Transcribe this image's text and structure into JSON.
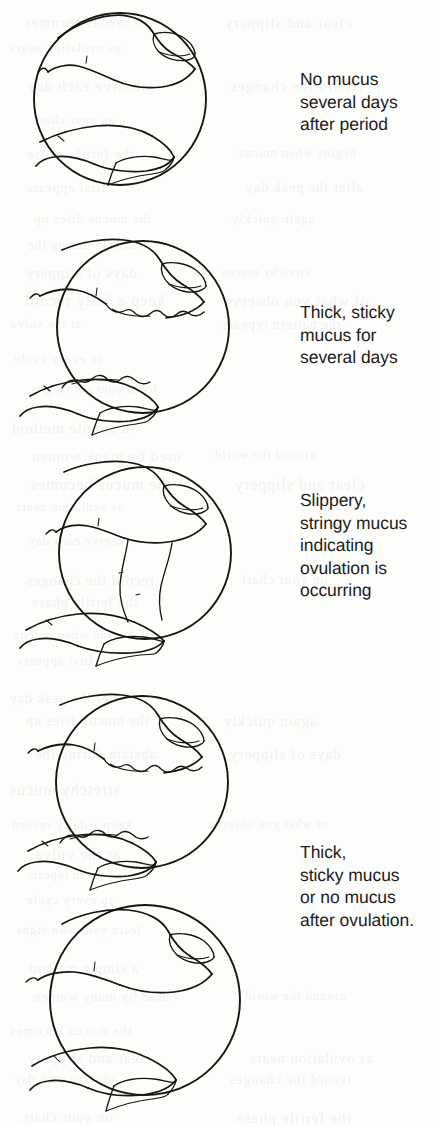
{
  "figure": {
    "medium": "line drawing",
    "panel_count": 5,
    "caption_count": 4,
    "ink_color": "#16150f",
    "page_color": "#fdfdfc",
    "page_width": 440,
    "page_height": 1126
  },
  "panels": [
    {
      "index": 1,
      "illustration_name": "fingers-no-mucus",
      "description": "Two fingertips apart, clean, no mucus strand",
      "circle": {
        "cx": 120,
        "cy": 99,
        "r": 86
      },
      "mucus_state": "none"
    },
    {
      "index": 2,
      "illustration_name": "fingers-thick-sticky-mucus",
      "description": "Two fingertips with thick lumpy sticky mucus on each pad",
      "circle": {
        "cx": 143,
        "cy": 327,
        "r": 86
      },
      "mucus_state": "thick-sticky"
    },
    {
      "index": 3,
      "illustration_name": "fingers-stringy-mucus-strand",
      "description": "Slippery stringy mucus stretched in a strand between the fingertips",
      "circle": {
        "cx": 145,
        "cy": 553,
        "r": 86
      },
      "mucus_state": "stringy-stretching"
    },
    {
      "index": 4,
      "illustration_name": "fingers-thick-sticky-mucus-post-ovulation",
      "description": "Two fingertips with thick lumpy sticky mucus after ovulation",
      "circle": {
        "cx": 142,
        "cy": 782,
        "r": 86
      },
      "mucus_state": "thick-sticky"
    },
    {
      "index": 5,
      "illustration_name": "fingers-no-mucus-post-ovulation",
      "description": "Two fingertips apart, clean, no mucus after ovulation",
      "circle": {
        "cx": 145,
        "cy": 1000,
        "r": 95
      },
      "mucus_state": "none"
    }
  ],
  "captions": [
    {
      "index": 1,
      "name": "caption-no-mucus",
      "text": "No mucus\nseveral days\nafter period",
      "lines": [
        "No mucus",
        "several days",
        "after period"
      ],
      "x": 300,
      "y": 68
    },
    {
      "index": 2,
      "name": "caption-thick-sticky",
      "text": "Thick, sticky\nmucus for\nseveral days",
      "lines": [
        "Thick, sticky",
        "mucus for",
        "several days"
      ],
      "x": 300,
      "y": 301
    },
    {
      "index": 3,
      "name": "caption-slippery-stringy",
      "text": "Slippery,\nstringy mucus\nindicating\novulation is\noccurring",
      "lines": [
        "Slippery,",
        "stringy mucus",
        "indicating",
        "ovulation is",
        "occurring"
      ],
      "x": 300,
      "y": 489
    },
    {
      "index": 4,
      "name": "caption-after-ovulation",
      "text": "Thick,\nsticky mucus\nor no mucus\nafter ovulation.",
      "lines": [
        "Thick,",
        "sticky mucus",
        "or no mucus",
        "after ovulation."
      ],
      "x": 300,
      "y": 841
    }
  ],
  "bleed_through": {
    "note": "faint mirrored text showing through from the reverse side of the scanned page",
    "lines": [
      "the mucus becomes",
      "clear and slippery",
      "as ovulation nears",
      "observe each day",
      "record the changes",
      "on your chart",
      "the fertile phase",
      "begins when mucus",
      "first appears",
      "after the peak day",
      "the mucus dries up",
      "again quickly",
      "abstain during the",
      "days of slippery",
      "stretchy mucus",
      "keep a daily record",
      "of what you observe",
      "at the vulva",
      "the pattern repeats",
      "in every cycle",
      "learn your own signs",
      "a simple method",
      "used by many women",
      "around the world"
    ]
  }
}
